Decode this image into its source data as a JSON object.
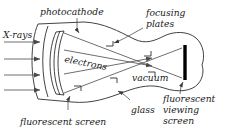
{
  "figure": {
    "background_color": "#ffffff",
    "ink_color": "#2e2e2e",
    "screen_color": "#000000"
  },
  "labels": {
    "photocathode": "photocathode",
    "xrays": "X-rays",
    "focusing_plates_line1": "focusing",
    "focusing_plates_line2": "plates",
    "electrons": "electrons",
    "vacuum": "vacuum",
    "glass": "glass",
    "fluorescent_screen": "fluorescent screen",
    "viewing_screen_line1": "fluorescent",
    "viewing_screen_line2": "viewing",
    "viewing_screen_line3": "screen"
  },
  "components": [
    {
      "name": "glass-envelope",
      "description": "tapered glass vacuum tube"
    },
    {
      "name": "photocathode",
      "description": "curved photocathode layer"
    },
    {
      "name": "fluorescent-screen",
      "description": "curved input fluorescent screen"
    },
    {
      "name": "focusing-plates",
      "description": "electrostatic focusing electrodes"
    },
    {
      "name": "fluorescent-viewing-screen",
      "description": "output viewing screen"
    }
  ],
  "rays": {
    "xray_count": 4,
    "electron_ray_count": 4,
    "xray_direction": "left-to-right"
  }
}
